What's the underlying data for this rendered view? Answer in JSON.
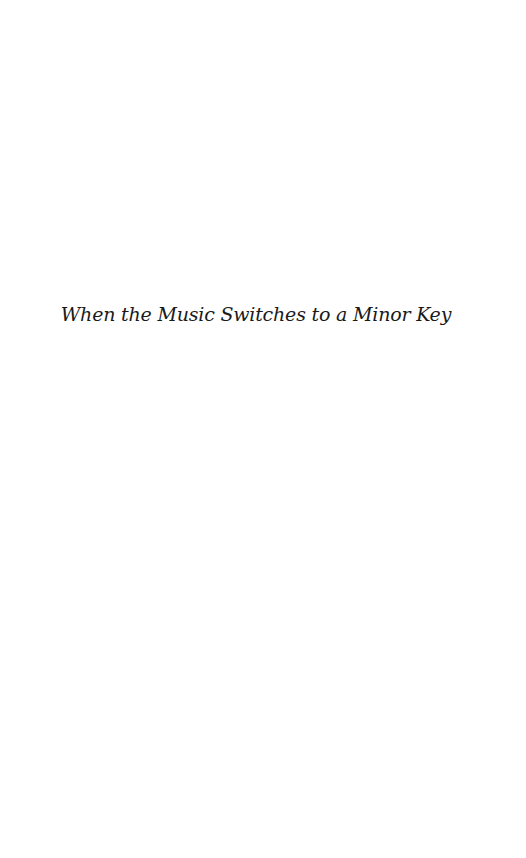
{
  "page": {
    "title": "When the Music Switches to a Minor Key"
  }
}
